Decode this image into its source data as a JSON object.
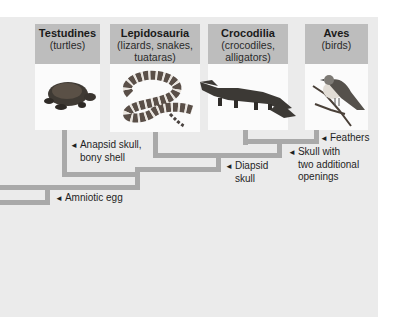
{
  "taxa": [
    {
      "name": "Testudines",
      "common": "(turtles)",
      "icon": "turtle-icon"
    },
    {
      "name": "Lepidosauria",
      "common_line1": "(lizards, snakes,",
      "common_line2": "tuataras)",
      "icon": "snake-icon"
    },
    {
      "name": "Crocodilia",
      "common_line1": "(crocodiles,",
      "common_line2": "alligators)",
      "icon": "alligator-icon"
    },
    {
      "name": "Aves",
      "common": "(birds)",
      "icon": "bird-icon"
    }
  ],
  "traits": {
    "anapsid_line1": "Anapsid skull,",
    "anapsid_line2": "bony shell",
    "amniotic": "Amniotic egg",
    "diapsid_line1": "Diapsid",
    "diapsid_line2": "skull",
    "skull_line1": "Skull with",
    "skull_line2": "two additional",
    "skull_line3": "openings",
    "feathers": "Feathers"
  },
  "marker": "◄",
  "colors": {
    "panel": "#ebebeb",
    "header": "#bdbdbd",
    "branch": "#a9a9a9"
  }
}
